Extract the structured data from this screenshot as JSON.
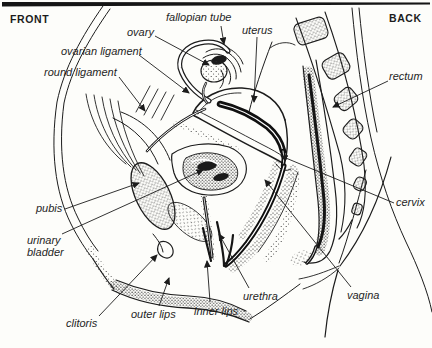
{
  "orientation": {
    "front": "FRONT",
    "back": "BACK"
  },
  "diagram": {
    "labels": [
      {
        "id": "fallopian-tube",
        "text": "fallopian tube",
        "x": 166,
        "y": 11,
        "line": [
          [
            221,
            26
          ],
          [
            224,
            44
          ]
        ]
      },
      {
        "id": "ovary",
        "text": "ovary",
        "x": 127,
        "y": 26,
        "line": [
          [
            155,
            36
          ],
          [
            209,
            65
          ]
        ]
      },
      {
        "id": "uterus",
        "text": "uterus",
        "x": 242,
        "y": 24,
        "line": [
          [
            257,
            37
          ],
          [
            254,
            102
          ]
        ]
      },
      {
        "id": "ovarian-ligament",
        "text": "ovarian ligament",
        "x": 61,
        "y": 45,
        "line": [
          [
            139,
            55
          ],
          [
            189,
            93
          ]
        ]
      },
      {
        "id": "round-ligament",
        "text": "round ligament",
        "x": 44,
        "y": 66,
        "line": [
          [
            119,
            77
          ],
          [
            145,
            111
          ]
        ]
      },
      {
        "id": "rectum",
        "text": "rectum",
        "x": 389,
        "y": 70,
        "line": [
          [
            388,
            81
          ],
          [
            333,
            107
          ]
        ]
      },
      {
        "id": "pubis",
        "text": "pubis",
        "x": 36,
        "y": 202,
        "line": [
          [
            65,
            209
          ],
          [
            139,
            183
          ]
        ]
      },
      {
        "id": "cervix",
        "text": "cervix",
        "x": 396,
        "y": 196,
        "line": [
          [
            394,
            203
          ],
          [
            281,
            156
          ]
        ]
      },
      {
        "id": "urinary-bladder",
        "text": "urinary\nbladder",
        "x": 27,
        "y": 234,
        "line": [
          [
            62,
            234
          ],
          [
            203,
            170
          ]
        ]
      },
      {
        "id": "clitoris",
        "text": "clitoris",
        "x": 66,
        "y": 317,
        "line": [
          [
            99,
            316
          ],
          [
            157,
            255
          ]
        ]
      },
      {
        "id": "outer-lips",
        "text": "outer lips",
        "x": 131,
        "y": 308,
        "line": [
          [
            159,
            306
          ],
          [
            169,
            278
          ]
        ]
      },
      {
        "id": "inner-lips",
        "text": "inner lips",
        "x": 194,
        "y": 305,
        "line": [
          [
            210,
            302
          ],
          [
            207,
            261
          ]
        ]
      },
      {
        "id": "urethra",
        "text": "urethra",
        "x": 243,
        "y": 290,
        "line": [
          [
            249,
            288
          ],
          [
            219,
            234
          ]
        ]
      },
      {
        "id": "vagina",
        "text": "vagina",
        "x": 347,
        "y": 289,
        "line": [
          [
            351,
            287
          ],
          [
            265,
            180
          ]
        ]
      }
    ]
  },
  "colors": {
    "ink": "#1c1c1c",
    "paper": "#fdfdfa"
  }
}
